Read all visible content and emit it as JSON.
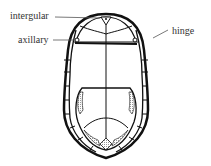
{
  "diagram": {
    "labels": {
      "intergular": "intergular",
      "axillary": "axillary",
      "hinge": "hinge"
    },
    "colors": {
      "line": "#111111",
      "shading": "#cfcfcf",
      "text": "#333333"
    }
  }
}
